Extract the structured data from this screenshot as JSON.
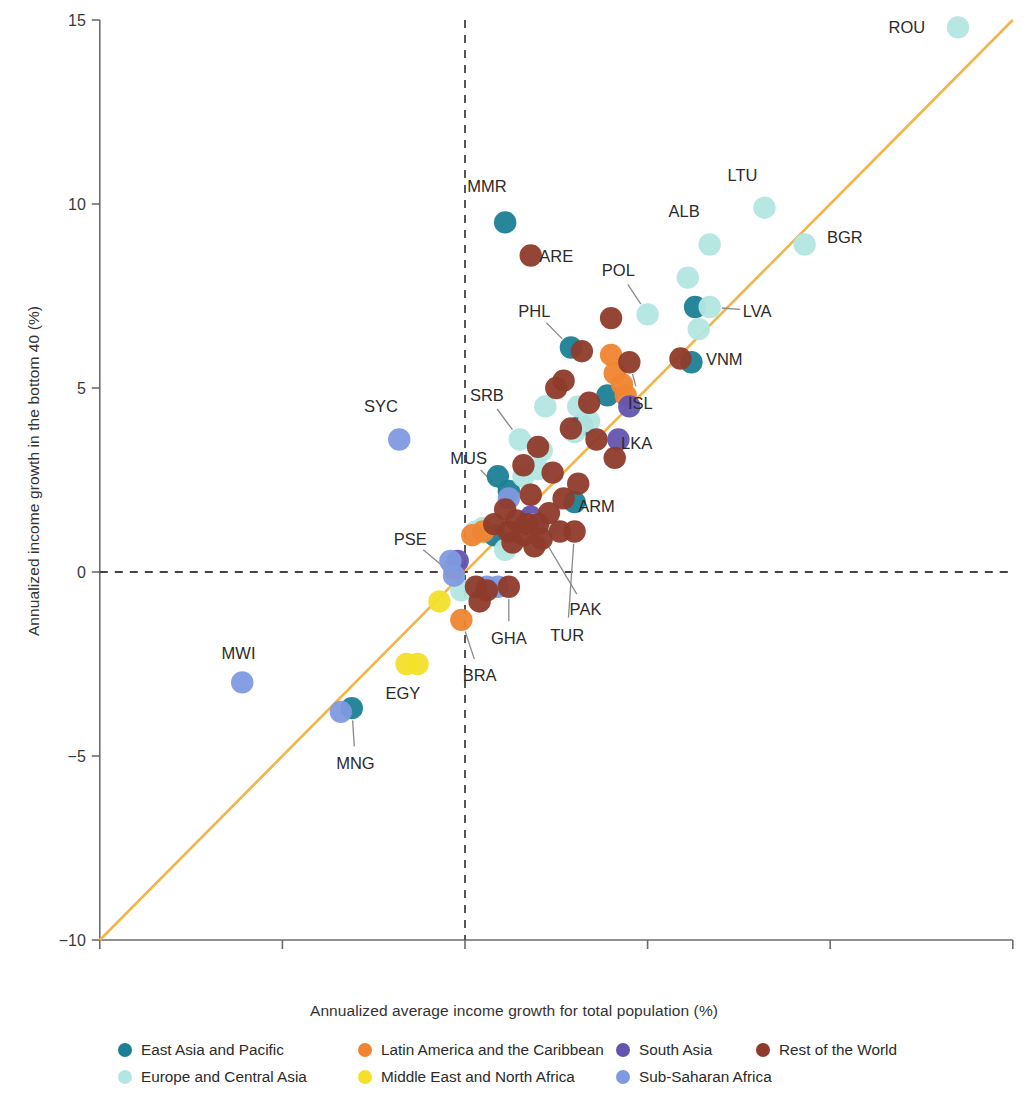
{
  "chart_data": {
    "type": "scatter",
    "title": "",
    "xlabel": "Annualized average income growth for total population (%)",
    "ylabel": "Annualized income growth in the bottom 40 (%)",
    "xlim": [
      -10,
      15
    ],
    "ylim": [
      -10,
      15
    ],
    "xticks": [
      -10,
      -5,
      0,
      5,
      10,
      15
    ],
    "yticks": [
      -10,
      -5,
      0,
      5,
      10,
      15
    ],
    "xticklabels": [
      "−10",
      "−5",
      "0",
      "5",
      "10",
      "15"
    ],
    "yticklabels": [
      "−10",
      "−5",
      "0",
      "5",
      "10",
      "15"
    ],
    "grid": false,
    "reference_lines": [
      {
        "name": "diagonal-45-line",
        "type": "identity",
        "color": "#f3b44a",
        "from": [
          -10,
          -10
        ],
        "to": [
          15,
          15
        ]
      },
      {
        "name": "zero-x-line",
        "type": "vertical-dashed",
        "color": "#444444",
        "value": 0
      },
      {
        "name": "zero-y-line",
        "type": "horizontal-dashed",
        "color": "#444444",
        "value": 0
      }
    ],
    "legend": {
      "position": "bottom",
      "entries": [
        {
          "label": "East Asia and Pacific",
          "color": "#1b7f95"
        },
        {
          "label": "Latin America and the Caribbean",
          "color": "#ef8532"
        },
        {
          "label": "South Asia",
          "color": "#6354b0"
        },
        {
          "label": "Rest of the World",
          "color": "#8e3b2b"
        },
        {
          "label": "Europe and Central Asia",
          "color": "#b3e6e2"
        },
        {
          "label": "Middle East and North Africa",
          "color": "#f2e02a"
        },
        {
          "label": "Sub-Saharan Africa",
          "color": "#7e9ae0"
        }
      ]
    },
    "series": [
      {
        "name": "East Asia and Pacific",
        "color": "#1b7f95",
        "points": [
          {
            "x": 1.1,
            "y": 9.5,
            "label": "MMR"
          },
          {
            "x": 2.9,
            "y": 6.1,
            "label": "PHL"
          },
          {
            "x": 6.2,
            "y": 5.7,
            "label": "VNM"
          },
          {
            "x": 6.3,
            "y": 7.2,
            "label": ""
          },
          {
            "x": 3.9,
            "y": 4.8,
            "label": ""
          },
          {
            "x": 3.0,
            "y": 1.9,
            "label": "ARM"
          },
          {
            "x": 0.9,
            "y": 2.6,
            "label": ""
          },
          {
            "x": 1.2,
            "y": 2.2,
            "label": ""
          },
          {
            "x": 0.8,
            "y": 1.0,
            "label": ""
          },
          {
            "x": 3.2,
            "y": 4.0,
            "label": ""
          },
          {
            "x": -3.1,
            "y": -3.7,
            "label": "MNG"
          }
        ]
      },
      {
        "name": "Europe and Central Asia",
        "color": "#b3e6e2",
        "points": [
          {
            "x": 13.5,
            "y": 14.8,
            "label": "ROU"
          },
          {
            "x": 8.2,
            "y": 9.9,
            "label": "LTU"
          },
          {
            "x": 6.7,
            "y": 8.9,
            "label": "ALB"
          },
          {
            "x": 9.3,
            "y": 8.9,
            "label": "BGR"
          },
          {
            "x": 6.1,
            "y": 8.0,
            "label": ""
          },
          {
            "x": 5.0,
            "y": 7.0,
            "label": "POL"
          },
          {
            "x": 6.7,
            "y": 7.2,
            "label": "LVA"
          },
          {
            "x": 6.4,
            "y": 6.6,
            "label": ""
          },
          {
            "x": 3.1,
            "y": 4.5,
            "label": ""
          },
          {
            "x": 2.2,
            "y": 4.5,
            "label": ""
          },
          {
            "x": 1.5,
            "y": 3.6,
            "label": "SRB"
          },
          {
            "x": 3.4,
            "y": 4.1,
            "label": ""
          },
          {
            "x": 2.1,
            "y": 3.3,
            "label": ""
          },
          {
            "x": 2.0,
            "y": 2.8,
            "label": ""
          },
          {
            "x": 1.6,
            "y": 2.6,
            "label": ""
          },
          {
            "x": 2.3,
            "y": 1.3,
            "label": ""
          },
          {
            "x": 0.5,
            "y": 1.2,
            "label": ""
          },
          {
            "x": 1.6,
            "y": 1.0,
            "label": ""
          },
          {
            "x": 0.3,
            "y": 1.1,
            "label": ""
          },
          {
            "x": 1.1,
            "y": 0.6,
            "label": ""
          },
          {
            "x": -0.1,
            "y": -0.5,
            "label": ""
          },
          {
            "x": 3.0,
            "y": 3.8,
            "label": ""
          }
        ]
      },
      {
        "name": "Latin America and the Caribbean",
        "color": "#ef8532",
        "points": [
          {
            "x": 4.0,
            "y": 5.9,
            "label": ""
          },
          {
            "x": 4.1,
            "y": 5.4,
            "label": ""
          },
          {
            "x": 4.3,
            "y": 5.1,
            "label": ""
          },
          {
            "x": 4.4,
            "y": 4.8,
            "label": ""
          },
          {
            "x": 0.5,
            "y": 1.1,
            "label": ""
          },
          {
            "x": 0.2,
            "y": 1.0,
            "label": ""
          },
          {
            "x": -0.3,
            "y": 0.1,
            "label": ""
          },
          {
            "x": -0.1,
            "y": -1.3,
            "label": "BRA"
          }
        ]
      },
      {
        "name": "Middle East and North Africa",
        "color": "#f2e02a",
        "points": [
          {
            "x": -1.6,
            "y": -2.5,
            "label": "EGY"
          },
          {
            "x": -1.3,
            "y": -2.5,
            "label": ""
          },
          {
            "x": -0.7,
            "y": -0.8,
            "label": ""
          }
        ]
      },
      {
        "name": "South Asia",
        "color": "#6354b0",
        "points": [
          {
            "x": 4.5,
            "y": 4.5,
            "label": ""
          },
          {
            "x": 4.2,
            "y": 3.6,
            "label": "LKA"
          },
          {
            "x": 1.8,
            "y": 1.5,
            "label": "PAK"
          },
          {
            "x": -0.2,
            "y": 0.3,
            "label": ""
          }
        ]
      },
      {
        "name": "Sub-Saharan Africa",
        "color": "#7e9ae0",
        "points": [
          {
            "x": -1.8,
            "y": 3.6,
            "label": "SYC"
          },
          {
            "x": -6.1,
            "y": -3.0,
            "label": "MWI"
          },
          {
            "x": -3.4,
            "y": -3.8,
            "label": ""
          },
          {
            "x": 1.2,
            "y": 2.0,
            "label": "MUS"
          },
          {
            "x": 1.9,
            "y": 1.3,
            "label": ""
          },
          {
            "x": -0.4,
            "y": 0.3,
            "label": ""
          },
          {
            "x": -0.3,
            "y": -0.1,
            "label": "PSE"
          },
          {
            "x": 0.6,
            "y": -0.4,
            "label": ""
          },
          {
            "x": 0.9,
            "y": -0.4,
            "label": ""
          }
        ]
      },
      {
        "name": "Rest of the World",
        "color": "#8e3b2b",
        "points": [
          {
            "x": 1.8,
            "y": 8.6,
            "label": "ARE"
          },
          {
            "x": 4.0,
            "y": 6.9,
            "label": ""
          },
          {
            "x": 4.5,
            "y": 5.7,
            "label": "ISL"
          },
          {
            "x": 5.9,
            "y": 5.8,
            "label": ""
          },
          {
            "x": 3.2,
            "y": 6.0,
            "label": ""
          },
          {
            "x": 2.7,
            "y": 5.2,
            "label": ""
          },
          {
            "x": 2.5,
            "y": 5.0,
            "label": ""
          },
          {
            "x": 3.4,
            "y": 4.6,
            "label": ""
          },
          {
            "x": 2.9,
            "y": 3.9,
            "label": ""
          },
          {
            "x": 3.6,
            "y": 3.6,
            "label": ""
          },
          {
            "x": 4.1,
            "y": 3.1,
            "label": ""
          },
          {
            "x": 2.0,
            "y": 3.4,
            "label": ""
          },
          {
            "x": 1.6,
            "y": 2.9,
            "label": ""
          },
          {
            "x": 2.4,
            "y": 2.7,
            "label": ""
          },
          {
            "x": 3.1,
            "y": 2.4,
            "label": ""
          },
          {
            "x": 1.8,
            "y": 2.1,
            "label": ""
          },
          {
            "x": 2.3,
            "y": 1.6,
            "label": ""
          },
          {
            "x": 1.1,
            "y": 1.7,
            "label": ""
          },
          {
            "x": 1.4,
            "y": 1.4,
            "label": ""
          },
          {
            "x": 1.7,
            "y": 1.3,
            "label": ""
          },
          {
            "x": 2.0,
            "y": 1.3,
            "label": ""
          },
          {
            "x": 1.2,
            "y": 1.1,
            "label": ""
          },
          {
            "x": 1.6,
            "y": 1.0,
            "label": ""
          },
          {
            "x": 2.1,
            "y": 0.9,
            "label": ""
          },
          {
            "x": 1.3,
            "y": 0.8,
            "label": ""
          },
          {
            "x": 1.9,
            "y": 0.7,
            "label": ""
          },
          {
            "x": 0.8,
            "y": 1.3,
            "label": ""
          },
          {
            "x": 2.6,
            "y": 1.1,
            "label": ""
          },
          {
            "x": 3.0,
            "y": 1.1,
            "label": "TUR"
          },
          {
            "x": 0.3,
            "y": -0.4,
            "label": ""
          },
          {
            "x": 0.6,
            "y": -0.5,
            "label": ""
          },
          {
            "x": 1.2,
            "y": -0.4,
            "label": "GHA"
          },
          {
            "x": 0.4,
            "y": -0.8,
            "label": ""
          },
          {
            "x": 2.7,
            "y": 2.0,
            "label": ""
          }
        ]
      }
    ],
    "annotations": [
      {
        "label": "ROU",
        "x": 13.5,
        "y": 14.8,
        "lx": 12.1,
        "ly": 14.8,
        "leader": false
      },
      {
        "label": "LTU",
        "x": 8.2,
        "y": 9.9,
        "lx": 7.6,
        "ly": 10.8,
        "leader": false
      },
      {
        "label": "ALB",
        "x": 6.7,
        "y": 8.9,
        "lx": 6.0,
        "ly": 9.8,
        "leader": false
      },
      {
        "label": "BGR",
        "x": 9.3,
        "y": 8.9,
        "lx": 10.4,
        "ly": 9.1,
        "leader": false
      },
      {
        "label": "POL",
        "x": 5.0,
        "y": 7.0,
        "lx": 4.2,
        "ly": 8.2,
        "leader": true
      },
      {
        "label": "LVA",
        "x": 6.7,
        "y": 7.2,
        "lx": 8.0,
        "ly": 7.1,
        "leader": true
      },
      {
        "label": "VNM",
        "x": 6.2,
        "y": 5.7,
        "lx": 7.1,
        "ly": 5.8,
        "leader": false
      },
      {
        "label": "ISL",
        "x": 4.5,
        "y": 5.7,
        "lx": 4.8,
        "ly": 4.6,
        "leader": true
      },
      {
        "label": "MMR",
        "x": 1.1,
        "y": 9.5,
        "lx": 0.6,
        "ly": 10.5,
        "leader": false
      },
      {
        "label": "ARE",
        "x": 1.8,
        "y": 8.6,
        "lx": 2.5,
        "ly": 8.6,
        "leader": false
      },
      {
        "label": "PHL",
        "x": 2.9,
        "y": 6.1,
        "lx": 1.9,
        "ly": 7.1,
        "leader": true
      },
      {
        "label": "SRB",
        "x": 1.5,
        "y": 3.6,
        "lx": 0.6,
        "ly": 4.8,
        "leader": true
      },
      {
        "label": "MUS",
        "x": 1.2,
        "y": 2.0,
        "lx": 0.1,
        "ly": 3.1,
        "leader": true
      },
      {
        "label": "LKA",
        "x": 4.2,
        "y": 3.6,
        "lx": 4.7,
        "ly": 3.5,
        "leader": false
      },
      {
        "label": "ARM",
        "x": 3.0,
        "y": 1.9,
        "lx": 3.6,
        "ly": 1.8,
        "leader": false
      },
      {
        "label": "SYC",
        "x": -1.8,
        "y": 3.6,
        "lx": -2.3,
        "ly": 4.5,
        "leader": false
      },
      {
        "label": "PSE",
        "x": -0.3,
        "y": -0.1,
        "lx": -1.5,
        "ly": 0.9,
        "leader": true
      },
      {
        "label": "PAK",
        "x": 1.8,
        "y": 1.5,
        "lx": 3.3,
        "ly": -1.0,
        "leader": true
      },
      {
        "label": "TUR",
        "x": 3.0,
        "y": 1.1,
        "lx": 2.8,
        "ly": -1.7,
        "leader": true
      },
      {
        "label": "GHA",
        "x": 1.2,
        "y": -0.4,
        "lx": 1.2,
        "ly": -1.8,
        "leader": true
      },
      {
        "label": "BRA",
        "x": -0.1,
        "y": -1.3,
        "lx": 0.4,
        "ly": -2.8,
        "leader": true
      },
      {
        "label": "EGY",
        "x": -1.6,
        "y": -2.5,
        "lx": -1.7,
        "ly": -3.3,
        "leader": false
      },
      {
        "label": "MWI",
        "x": -6.1,
        "y": -3.0,
        "lx": -6.2,
        "ly": -2.2,
        "leader": false
      },
      {
        "label": "MNG",
        "x": -3.1,
        "y": -3.7,
        "lx": -3.0,
        "ly": -5.2,
        "leader": true
      }
    ]
  }
}
